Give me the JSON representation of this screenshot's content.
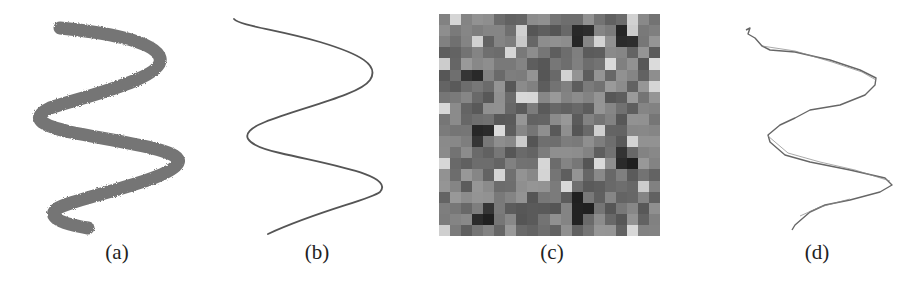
{
  "figure": {
    "panels": [
      {
        "id": "a",
        "caption": "(a)",
        "description": "thick noisy gray sinusoidal stroke"
      },
      {
        "id": "b",
        "caption": "(b)",
        "description": "thin smooth sinusoidal curve"
      },
      {
        "id": "c",
        "caption": "(c)",
        "description": "grayscale pixel grid (noise image)"
      },
      {
        "id": "d",
        "caption": "(d)",
        "description": "thin jagged reconstructed sinusoidal curve"
      }
    ],
    "colors": {
      "stroke_thick": "#6e6e6e",
      "stroke_thin": "#555555",
      "grid_base": "#9a9a9a"
    }
  }
}
